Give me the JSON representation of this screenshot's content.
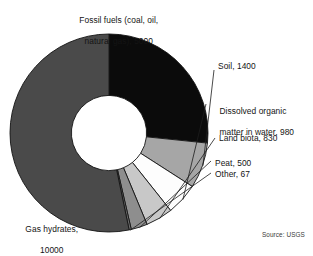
{
  "figure": {
    "source_note": "Source: USGS",
    "caption": ""
  },
  "chart_data": {
    "type": "pie",
    "title": "",
    "subtitle": "",
    "xlabel": "",
    "ylabel": "",
    "units": "gigatons of carbon",
    "donut": true,
    "inner_radius_ratio": 0.38,
    "start_angle_deg": 0,
    "direction": "clockwise",
    "legend_position": "outside-labels",
    "grid": false,
    "total": 18777,
    "categories": [
      "Fossil fuels (coal, oil, natural gas)",
      "Soil",
      "Dissolved organic matter in water",
      "Land biota",
      "Peat",
      "Other",
      "Gas hydrates"
    ],
    "values": [
      5000,
      1400,
      980,
      830,
      500,
      67,
      10000
    ],
    "colors": [
      "#0b0b0b",
      "#a6a6a6",
      "#fdfdfd",
      "#c8c8c8",
      "#8e8e8e",
      "#6e6e6e",
      "#4a4a4a"
    ],
    "labels": [
      "Fossil fuels (coal, oil,\nnatural gas), 5000",
      "Soil, 1400",
      "Dissolved organic\nmatter in water, 980",
      "Land biota, 830",
      "Peat, 500",
      "Other, 67",
      "Gas hydrates,\n10000"
    ],
    "slices": [
      {
        "name": "Fossil fuels (coal, oil, natural gas)",
        "value": 5000,
        "label": "Fossil fuels (coal, oil,\nnatural gas), 5000",
        "color": "#0b0b0b",
        "percent": 26.6
      },
      {
        "name": "Soil",
        "value": 1400,
        "label": "Soil, 1400",
        "color": "#a6a6a6",
        "percent": 7.5
      },
      {
        "name": "Dissolved organic matter in water",
        "value": 980,
        "label": "Dissolved organic\nmatter in water, 980",
        "color": "#fdfdfd",
        "percent": 5.2
      },
      {
        "name": "Land biota",
        "value": 830,
        "label": "Land biota, 830",
        "color": "#c8c8c8",
        "percent": 4.4
      },
      {
        "name": "Peat",
        "value": 500,
        "label": "Peat, 500",
        "color": "#8e8e8e",
        "percent": 2.7
      },
      {
        "name": "Other",
        "value": 67,
        "label": "Other, 67",
        "color": "#6e6e6e",
        "percent": 0.4
      },
      {
        "name": "Gas hydrates",
        "value": 10000,
        "label": "Gas hydrates,\n10000",
        "color": "#4a4a4a",
        "percent": 53.3
      }
    ]
  },
  "labels": {
    "fossil_fuels_line1": "Fossil fuels (coal, oil,",
    "fossil_fuels_line2": "natural gas), 5000",
    "soil": "Soil, 1400",
    "dissolved_line1": "Dissolved organic",
    "dissolved_line2": "matter in water, 980",
    "land_biota": "Land biota, 830",
    "peat": "Peat, 500",
    "other": "Other, 67",
    "gas_hydrates_line1": "Gas hydrates,",
    "gas_hydrates_line2": "10000"
  }
}
